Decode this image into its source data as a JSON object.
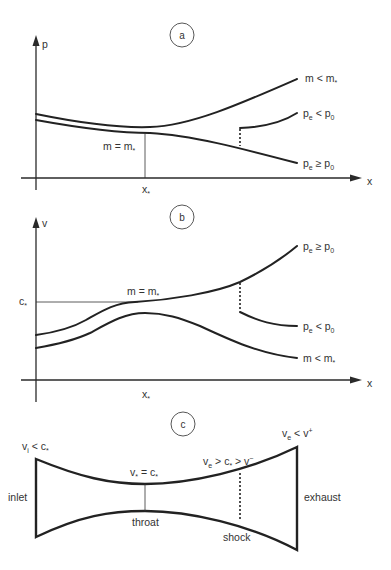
{
  "colors": {
    "ink": "#222222",
    "text": "#333333",
    "background": "#ffffff"
  },
  "panels": {
    "a": {
      "badge": "a",
      "y_axis_label": "p",
      "x_axis_label": "x",
      "x_tick": {
        "base": "x",
        "sub": "*"
      },
      "throat_label": {
        "base": "m",
        "op": " = ",
        "base2": "m",
        "sub2": "*"
      },
      "curves": [
        {
          "id": "subsonic",
          "label": {
            "base": "m",
            "op": " < ",
            "base2": "m",
            "sub2": "*"
          }
        },
        {
          "id": "shock-branch",
          "label": {
            "base": "p",
            "sub": "e",
            "op": " < ",
            "base2": "p",
            "sub2": "0"
          }
        },
        {
          "id": "supersonic",
          "label": {
            "base": "p",
            "sub": "e",
            "op": " ≥ ",
            "base2": "p",
            "sub2": "0"
          }
        }
      ]
    },
    "b": {
      "badge": "b",
      "y_axis_label": "v",
      "x_axis_label": "x",
      "x_tick": {
        "base": "x",
        "sub": "*"
      },
      "y_tick": {
        "base": "c",
        "sub": "*"
      },
      "throat_label": {
        "base": "m",
        "op": " = ",
        "base2": "m",
        "sub2": "*"
      },
      "curves": [
        {
          "id": "supersonic",
          "label": {
            "base": "p",
            "sub": "e",
            "op": " ≥ ",
            "base2": "p",
            "sub2": "0"
          }
        },
        {
          "id": "shock-branch",
          "label": {
            "base": "p",
            "sub": "e",
            "op": " < ",
            "base2": "p",
            "sub2": "0"
          }
        },
        {
          "id": "subsonic",
          "label": {
            "base": "m",
            "op": " < ",
            "base2": "m",
            "sub2": "*"
          }
        }
      ]
    },
    "c": {
      "badge": "c",
      "inlet_label": "inlet",
      "exhaust_label": "exhaust",
      "throat_label": "throat",
      "shock_label": "shock",
      "inlet_condition": {
        "base": "v",
        "sub": "i",
        "op": " < ",
        "base2": "c",
        "sub2": "*"
      },
      "throat_condition": {
        "base": "v",
        "sub": "*",
        "op": " = ",
        "base2": "c",
        "sub2": "*"
      },
      "shock_condition": {
        "base": "v",
        "sub": "e",
        "op": " > ",
        "base2": "c",
        "sub2": "*",
        "op2": " > ",
        "base3": "v",
        "sup3": "−"
      },
      "exhaust_condition": {
        "base": "v",
        "sub": "e",
        "op": " < ",
        "base2": "v",
        "sup2": "+"
      }
    }
  }
}
